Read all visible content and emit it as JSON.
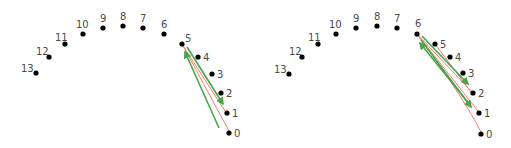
{
  "diagram": {
    "colors": {
      "dot": "#000000",
      "label": "#4a4a4a",
      "red_line": "#e9826e",
      "green_arrow": "#4ea24e"
    },
    "panels": [
      {
        "id": "left",
        "nodes": [
          {
            "label": "0",
            "x": 229,
            "y": 133
          },
          {
            "label": "1",
            "x": 227,
            "y": 113
          },
          {
            "label": "2",
            "x": 221,
            "y": 93
          },
          {
            "label": "3",
            "x": 212,
            "y": 74
          },
          {
            "label": "4",
            "x": 198,
            "y": 57
          },
          {
            "label": "5",
            "x": 182,
            "y": 44
          },
          {
            "label": "6",
            "x": 164,
            "y": 34
          },
          {
            "label": "7",
            "x": 143,
            "y": 28
          },
          {
            "label": "8",
            "x": 123,
            "y": 26
          },
          {
            "label": "9",
            "x": 103,
            "y": 28
          },
          {
            "label": "10",
            "x": 83,
            "y": 34
          },
          {
            "label": "11",
            "x": 65,
            "y": 44
          },
          {
            "label": "12",
            "x": 49,
            "y": 57
          },
          {
            "label": "13",
            "x": 36,
            "y": 73
          }
        ],
        "red_lines": [
          {
            "from": [
              182,
              44
            ],
            "to": [
              229,
              131
            ]
          },
          {
            "from": [
              182,
              44
            ],
            "to": [
              225,
              111
            ]
          }
        ],
        "green_arrows": [
          {
            "from": [
              187,
              47
            ],
            "to": [
              223,
              104
            ]
          },
          {
            "from": [
              219,
              128
            ],
            "to": [
              185,
              52
            ]
          }
        ]
      },
      {
        "id": "right",
        "nodes": [
          {
            "label": "0",
            "x": 481,
            "y": 134
          },
          {
            "label": "1",
            "x": 479,
            "y": 113
          },
          {
            "label": "2",
            "x": 473,
            "y": 93
          },
          {
            "label": "3",
            "x": 463,
            "y": 73
          },
          {
            "label": "4",
            "x": 450,
            "y": 57
          },
          {
            "label": "5",
            "x": 435,
            "y": 44
          },
          {
            "label": "6",
            "x": 417,
            "y": 34
          },
          {
            "label": "7",
            "x": 397,
            "y": 28
          },
          {
            "label": "8",
            "x": 377,
            "y": 26
          },
          {
            "label": "9",
            "x": 356,
            "y": 28
          },
          {
            "label": "10",
            "x": 336,
            "y": 34
          },
          {
            "label": "11",
            "x": 318,
            "y": 44
          },
          {
            "label": "12",
            "x": 302,
            "y": 57
          },
          {
            "label": "13",
            "x": 289,
            "y": 74
          }
        ],
        "red_lines": [
          {
            "from": [
              417,
              34
            ],
            "to": [
              481,
              132
            ],
            "curve": [
              462,
              95
            ]
          },
          {
            "from": [
              417,
              34
            ],
            "to": [
              478,
              111
            ]
          },
          {
            "from": [
              417,
              34
            ],
            "to": [
              472,
              92
            ]
          },
          {
            "from": [
              435,
              44
            ],
            "to": [
              471,
              92
            ]
          }
        ],
        "green_arrows": [
          {
            "from": [
              422,
              36
            ],
            "to": [
              468,
              84
            ]
          },
          {
            "from": [
              470,
              105
            ],
            "to": [
              420,
              43
            ]
          },
          {
            "from": [
              421,
              40
            ],
            "to": [
              471,
              107
            ]
          }
        ]
      }
    ]
  }
}
